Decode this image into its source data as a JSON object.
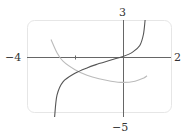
{
  "chart_data": {
    "type": "line",
    "title": "",
    "xlabel": "",
    "ylabel": "",
    "xlim": [
      -4,
      2
    ],
    "ylim": [
      -5,
      3
    ],
    "grid": false,
    "legend": "none",
    "tick_labels": {
      "x_min": "−4",
      "x_max": "2",
      "y_max": "3",
      "y_min": "−5"
    },
    "x_ticks": [
      -2
    ],
    "series": [
      {
        "name": "dark curve",
        "color": "#555555",
        "points": [
          [
            -2.85,
            -5
          ],
          [
            -2.75,
            -3.2
          ],
          [
            -2.5,
            -2.1
          ],
          [
            -2.0,
            -1.4
          ],
          [
            -1.5,
            -0.95
          ],
          [
            -1.0,
            -0.6
          ],
          [
            -0.5,
            -0.3
          ],
          [
            0.0,
            0.0
          ],
          [
            0.4,
            0.35
          ],
          [
            0.7,
            0.9
          ],
          [
            0.85,
            1.8
          ],
          [
            0.92,
            3
          ]
        ]
      },
      {
        "name": "light curve",
        "color": "#bbbbbb",
        "points": [
          [
            -3.0,
            1.4
          ],
          [
            -2.75,
            0.3
          ],
          [
            -2.5,
            -0.4
          ],
          [
            -2.0,
            -1.1
          ],
          [
            -1.5,
            -1.55
          ],
          [
            -1.0,
            -1.85
          ],
          [
            -0.5,
            -2.05
          ],
          [
            0.0,
            -2.15
          ],
          [
            0.5,
            -2.05
          ],
          [
            0.85,
            -1.8
          ],
          [
            1.0,
            -1.6
          ]
        ]
      }
    ]
  },
  "axes": {
    "x_min_label": "−4",
    "x_max_label": "2",
    "y_max_label": "3",
    "y_min_label": "−5"
  }
}
